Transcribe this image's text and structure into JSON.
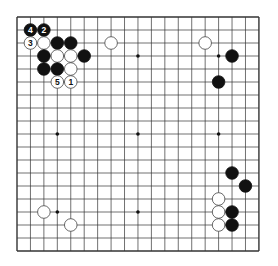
{
  "board": {
    "size": 19,
    "origin_x": 17,
    "origin_y": 17,
    "spacing_x": 13.44,
    "spacing_y": 13.0,
    "line_color": "#333333",
    "background": "#ffffff",
    "star_points": [
      [
        3,
        3
      ],
      [
        9,
        3
      ],
      [
        15,
        3
      ],
      [
        3,
        9
      ],
      [
        9,
        9
      ],
      [
        15,
        9
      ],
      [
        3,
        15
      ],
      [
        9,
        15
      ],
      [
        15,
        15
      ]
    ]
  },
  "colors": {
    "black_stone": "#111111",
    "white_stone": "#ffffff",
    "white_stone_edge": "#444444",
    "label_on_black": "#ffffff",
    "label_on_white": "#111111"
  },
  "stones": [
    {
      "color": "black",
      "col": 1,
      "row": 1,
      "label": "4"
    },
    {
      "color": "black",
      "col": 2,
      "row": 1,
      "label": "2"
    },
    {
      "color": "white",
      "col": 1,
      "row": 2,
      "label": "3"
    },
    {
      "color": "white",
      "col": 2,
      "row": 2,
      "label": ""
    },
    {
      "color": "black",
      "col": 3,
      "row": 2,
      "label": ""
    },
    {
      "color": "black",
      "col": 4,
      "row": 2,
      "label": ""
    },
    {
      "color": "black",
      "col": 2,
      "row": 3,
      "label": ""
    },
    {
      "color": "white",
      "col": 3,
      "row": 3,
      "label": ""
    },
    {
      "color": "white",
      "col": 4,
      "row": 3,
      "label": ""
    },
    {
      "color": "black",
      "col": 5,
      "row": 3,
      "label": ""
    },
    {
      "color": "black",
      "col": 2,
      "row": 4,
      "label": ""
    },
    {
      "color": "black",
      "col": 3,
      "row": 4,
      "label": ""
    },
    {
      "color": "white",
      "col": 4,
      "row": 4,
      "label": ""
    },
    {
      "color": "white",
      "col": 3,
      "row": 5,
      "label": "5"
    },
    {
      "color": "white",
      "col": 4,
      "row": 5,
      "label": "1"
    },
    {
      "color": "white",
      "col": 7,
      "row": 2,
      "label": ""
    },
    {
      "color": "white",
      "col": 14,
      "row": 2,
      "label": ""
    },
    {
      "color": "black",
      "col": 16,
      "row": 3,
      "label": ""
    },
    {
      "color": "black",
      "col": 15,
      "row": 5,
      "label": ""
    },
    {
      "color": "black",
      "col": 16,
      "row": 12,
      "label": ""
    },
    {
      "color": "black",
      "col": 17,
      "row": 13,
      "label": ""
    },
    {
      "color": "white",
      "col": 15,
      "row": 14,
      "label": ""
    },
    {
      "color": "white",
      "col": 15,
      "row": 15,
      "label": ""
    },
    {
      "color": "black",
      "col": 16,
      "row": 15,
      "label": ""
    },
    {
      "color": "white",
      "col": 15,
      "row": 16,
      "label": ""
    },
    {
      "color": "black",
      "col": 16,
      "row": 16,
      "label": ""
    },
    {
      "color": "white",
      "col": 2,
      "row": 15,
      "label": ""
    },
    {
      "color": "white",
      "col": 4,
      "row": 16,
      "label": ""
    }
  ]
}
